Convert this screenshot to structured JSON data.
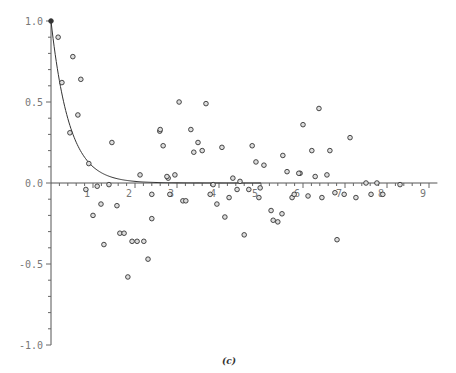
{
  "chart_data": {
    "type": "scatter",
    "title": "",
    "caption": "(c)",
    "xlabel": "",
    "ylabel": "",
    "xlim": [
      0,
      9.2
    ],
    "ylim": [
      -1.0,
      1.0
    ],
    "grid": false,
    "legend": "none",
    "x_ticks": [
      "1",
      "2",
      "3",
      "4",
      "5",
      "6",
      "7",
      "8",
      "9"
    ],
    "y_ticks": [
      "1.0",
      "0.5",
      "0.0",
      "-0.5",
      "-1.0"
    ],
    "series": [
      {
        "name": "exponential decay curve",
        "kind": "line",
        "formula": "y = exp(-2.3 x)",
        "color": "#333333"
      },
      {
        "name": "sample points",
        "kind": "scatter",
        "color": "#333333",
        "points": [
          [
            0.0,
            1.0
          ],
          [
            0.17,
            0.9
          ],
          [
            0.52,
            0.78
          ],
          [
            0.26,
            0.62
          ],
          [
            0.71,
            0.64
          ],
          [
            0.64,
            0.42
          ],
          [
            0.45,
            0.31
          ],
          [
            0.9,
            0.12
          ],
          [
            1.45,
            0.25
          ],
          [
            2.59,
            0.32
          ],
          [
            2.67,
            0.23
          ],
          [
            2.12,
            0.05
          ],
          [
            2.79,
            0.03
          ],
          [
            3.05,
            0.5
          ],
          [
            3.69,
            0.49
          ],
          [
            2.6,
            0.33
          ],
          [
            3.33,
            0.33
          ],
          [
            3.5,
            0.25
          ],
          [
            3.4,
            0.19
          ],
          [
            3.6,
            0.2
          ],
          [
            4.07,
            0.22
          ],
          [
            4.79,
            0.23
          ],
          [
            4.88,
            0.13
          ],
          [
            5.07,
            0.11
          ],
          [
            5.52,
            0.17
          ],
          [
            5.62,
            0.07
          ],
          [
            5.93,
            0.06
          ],
          [
            2.76,
            0.04
          ],
          [
            2.95,
            0.05
          ],
          [
            4.33,
            0.03
          ],
          [
            4.5,
            0.01
          ],
          [
            6.38,
            0.46
          ],
          [
            6.0,
            0.36
          ],
          [
            7.12,
            0.28
          ],
          [
            6.21,
            0.2
          ],
          [
            6.64,
            0.2
          ],
          [
            5.9,
            0.06
          ],
          [
            6.29,
            0.04
          ],
          [
            6.57,
            0.05
          ],
          [
            7.5,
            0.0
          ],
          [
            7.76,
            0.0
          ],
          [
            8.31,
            -0.01
          ],
          [
            0.83,
            -0.04
          ],
          [
            1.1,
            -0.02
          ],
          [
            1.38,
            -0.01
          ],
          [
            1.19,
            -0.13
          ],
          [
            1.0,
            -0.2
          ],
          [
            1.57,
            -0.14
          ],
          [
            1.26,
            -0.38
          ],
          [
            1.64,
            -0.31
          ],
          [
            1.74,
            -0.31
          ],
          [
            1.93,
            -0.36
          ],
          [
            2.05,
            -0.36
          ],
          [
            2.21,
            -0.36
          ],
          [
            2.31,
            -0.47
          ],
          [
            1.83,
            -0.58
          ],
          [
            2.4,
            -0.22
          ],
          [
            2.4,
            -0.07
          ],
          [
            2.83,
            -0.07
          ],
          [
            3.14,
            -0.11
          ],
          [
            3.21,
            -0.11
          ],
          [
            3.86,
            -0.01
          ],
          [
            3.79,
            -0.07
          ],
          [
            3.95,
            -0.13
          ],
          [
            4.24,
            -0.09
          ],
          [
            4.14,
            -0.21
          ],
          [
            4.43,
            -0.04
          ],
          [
            4.71,
            -0.04
          ],
          [
            4.6,
            -0.32
          ],
          [
            4.98,
            -0.03
          ],
          [
            4.95,
            -0.09
          ],
          [
            5.24,
            -0.17
          ],
          [
            5.29,
            -0.23
          ],
          [
            5.4,
            -0.24
          ],
          [
            5.5,
            -0.19
          ],
          [
            5.74,
            -0.09
          ],
          [
            5.79,
            -0.07
          ],
          [
            6.12,
            -0.08
          ],
          [
            6.45,
            -0.09
          ],
          [
            6.76,
            -0.06
          ],
          [
            6.81,
            -0.35
          ],
          [
            6.98,
            -0.07
          ],
          [
            7.26,
            -0.09
          ],
          [
            7.62,
            -0.07
          ],
          [
            7.9,
            -0.07
          ]
        ]
      }
    ]
  }
}
